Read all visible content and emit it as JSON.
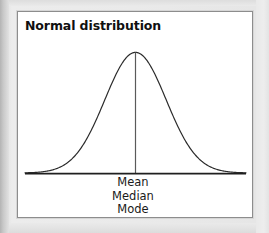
{
  "figure": {
    "title": "Normal distribution",
    "background_color": "#e9e9e9",
    "panel_color": "#ffffff",
    "panel_border_color": "#8d8d8d",
    "ink_color": "#1a1a1a"
  },
  "labels": {
    "mean": "Mean",
    "median": "Median",
    "mode": "Mode"
  },
  "chart_data": {
    "type": "line",
    "title": "Normal distribution",
    "xlabel": "",
    "ylabel": "",
    "grid": false,
    "legend": "none",
    "annotations": [
      "Mean",
      "Median",
      "Mode"
    ],
    "annotation_x": 0,
    "distribution": {
      "name": "normal",
      "mean": 0,
      "sd": 1
    },
    "xlim": [
      -3.6,
      3.6
    ],
    "ylim": [
      0,
      0.42
    ],
    "x": [
      -3.6,
      -3.3,
      -3.0,
      -2.7,
      -2.4,
      -2.1,
      -1.8,
      -1.5,
      -1.2,
      -0.9,
      -0.6,
      -0.3,
      0.0,
      0.3,
      0.6,
      0.9,
      1.2,
      1.5,
      1.8,
      2.1,
      2.4,
      2.7,
      3.0,
      3.3,
      3.6
    ],
    "y": [
      0.0006,
      0.0017,
      0.0044,
      0.0104,
      0.0224,
      0.044,
      0.079,
      0.1295,
      0.1942,
      0.2661,
      0.3332,
      0.3814,
      0.3989,
      0.3814,
      0.3332,
      0.2661,
      0.1942,
      0.1295,
      0.079,
      0.044,
      0.0224,
      0.0104,
      0.0044,
      0.0017,
      0.0006
    ],
    "series": [
      {
        "name": "Normal density",
        "values": [
          0.0006,
          0.0017,
          0.0044,
          0.0104,
          0.0224,
          0.044,
          0.079,
          0.1295,
          0.1942,
          0.2661,
          0.3332,
          0.3814,
          0.3989,
          0.3814,
          0.3332,
          0.2661,
          0.1942,
          0.1295,
          0.079,
          0.044,
          0.0224,
          0.0104,
          0.0044,
          0.0017,
          0.0006
        ]
      }
    ]
  }
}
